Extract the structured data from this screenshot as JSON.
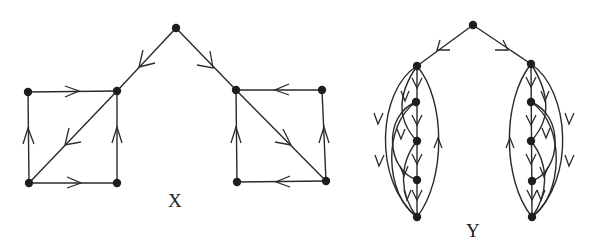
{
  "figure": {
    "graphs": [
      {
        "label": "X",
        "label_pos": [
          175,
          207
        ],
        "nodes": {
          "top": [
            176,
            28
          ],
          "lTR": [
            117,
            91
          ],
          "lTL": [
            28,
            92
          ],
          "lBL": [
            29,
            183
          ],
          "lBR": [
            117,
            183
          ],
          "rTL": [
            236,
            90
          ],
          "rTR": [
            322,
            90
          ],
          "rBL": [
            237,
            182
          ],
          "rBR": [
            326,
            181
          ]
        },
        "edges": [
          {
            "from": "top",
            "to": "lTR"
          },
          {
            "from": "top",
            "to": "rTL"
          },
          {
            "from": "lTL",
            "to": "lTR"
          },
          {
            "from": "lBL",
            "to": "lTL"
          },
          {
            "from": "lTR",
            "to": "lBL"
          },
          {
            "from": "lBR",
            "to": "lTR"
          },
          {
            "from": "lBL",
            "to": "lBR"
          },
          {
            "from": "rTR",
            "to": "rTL"
          },
          {
            "from": "rBL",
            "to": "rTL"
          },
          {
            "from": "rTL",
            "to": "rBR"
          },
          {
            "from": "rBR",
            "to": "rTR"
          },
          {
            "from": "rBR",
            "to": "rBL"
          }
        ]
      },
      {
        "label": "Y",
        "label_pos": [
          473,
          235
        ],
        "nodes": {
          "top": [
            473,
            25
          ],
          "l0": [
            417,
            66
          ],
          "l1": [
            416,
            102
          ],
          "l2": [
            417,
            141
          ],
          "l3": [
            417,
            180
          ],
          "l4": [
            417,
            217
          ],
          "r0": [
            531,
            64
          ],
          "r1": [
            531,
            102
          ],
          "r2": [
            531,
            141
          ],
          "r3": [
            532,
            181
          ],
          "r4": [
            532,
            217
          ]
        },
        "edges": [
          {
            "from": "top",
            "to": "l0"
          },
          {
            "from": "top",
            "to": "r0"
          }
        ]
      }
    ]
  }
}
